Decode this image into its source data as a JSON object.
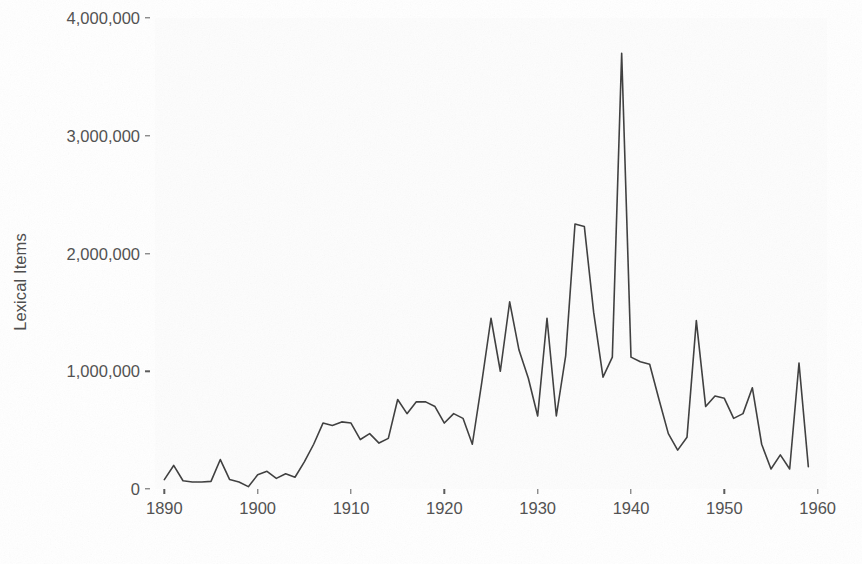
{
  "chart_data": {
    "type": "line",
    "title": "",
    "subtitle": "",
    "xlabel": "",
    "ylabel": "Lexical Items",
    "xlim": [
      1889,
      1961
    ],
    "ylim": [
      0,
      4000000
    ],
    "grid": false,
    "legend": null,
    "x_ticks": [
      1890,
      1900,
      1910,
      1920,
      1930,
      1940,
      1950,
      1960
    ],
    "x_tick_labels": [
      "1890",
      "1900",
      "1910",
      "1920",
      "1930",
      "1940",
      "1950",
      "1960"
    ],
    "y_ticks": [
      0,
      1000000,
      2000000,
      3000000,
      4000000
    ],
    "y_tick_labels": [
      "0",
      "1,000,000",
      "2,000,000",
      "3,000,000",
      "4,000,000"
    ],
    "line_color": "#3d3d3d",
    "line_width": 1.6,
    "x": [
      1890,
      1891,
      1892,
      1893,
      1894,
      1895,
      1896,
      1897,
      1898,
      1899,
      1900,
      1901,
      1902,
      1903,
      1904,
      1905,
      1906,
      1907,
      1908,
      1909,
      1910,
      1911,
      1912,
      1913,
      1914,
      1915,
      1916,
      1917,
      1918,
      1919,
      1920,
      1921,
      1922,
      1923,
      1924,
      1925,
      1926,
      1927,
      1928,
      1929,
      1930,
      1931,
      1932,
      1933,
      1934,
      1935,
      1936,
      1937,
      1938,
      1939,
      1940,
      1941,
      1942,
      1943,
      1944,
      1945,
      1946,
      1947,
      1948,
      1949,
      1950,
      1951,
      1952,
      1953,
      1954,
      1955,
      1956,
      1957,
      1958,
      1959,
      1960
    ],
    "y": [
      80000,
      200000,
      70000,
      60000,
      60000,
      65000,
      250000,
      80000,
      60000,
      20000,
      120000,
      150000,
      90000,
      130000,
      100000,
      230000,
      380000,
      560000,
      540000,
      570000,
      560000,
      420000,
      470000,
      390000,
      430000,
      760000,
      640000,
      740000,
      740000,
      700000,
      560000,
      640000,
      600000,
      380000,
      900000,
      1450000,
      1000000,
      1590000,
      1180000,
      940000,
      620000,
      1450000,
      620000,
      1130000,
      2250000,
      2230000,
      1500000,
      950000,
      1120000,
      3700000,
      1120000,
      1080000,
      1060000,
      760000,
      470000,
      330000,
      440000,
      1430000,
      700000,
      790000,
      770000,
      600000,
      640000,
      860000,
      380000,
      170000,
      290000,
      170000,
      1070000,
      190000
    ]
  },
  "axis": {
    "y_title": "Lexical Items"
  }
}
